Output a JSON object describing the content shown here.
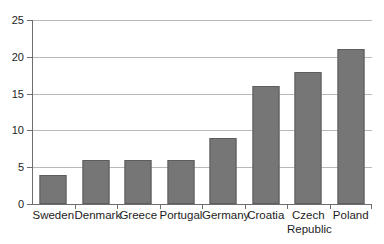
{
  "chart_data": {
    "type": "bar",
    "title": "",
    "subtitle": "",
    "xlabel": "",
    "ylabel": "",
    "categories": [
      "Sweden",
      "Denmark",
      "Greece",
      "Portugal",
      "Germany",
      "Croatia",
      "Czech\nRepublic",
      "Poland"
    ],
    "values": [
      4,
      6,
      6,
      6,
      9,
      16,
      18,
      21
    ],
    "ylim": [
      0,
      25
    ],
    "ytick_labels": [
      "0",
      "5",
      "10",
      "15",
      "20",
      "25"
    ],
    "ytick_values": [
      0,
      5,
      10,
      15,
      20,
      25
    ],
    "grid": "horizontal",
    "legend": "none",
    "series": [
      {
        "name": "",
        "values": [
          4,
          6,
          6,
          6,
          9,
          16,
          18,
          21
        ]
      }
    ],
    "colors": {
      "bar_fill": "#767676",
      "bar_edge": "#5d5d5d",
      "grid_line": "#b9b9b9",
      "axis_line": "#6e6e6e",
      "text": "#1d1d1d",
      "background": "#ffffff"
    }
  }
}
